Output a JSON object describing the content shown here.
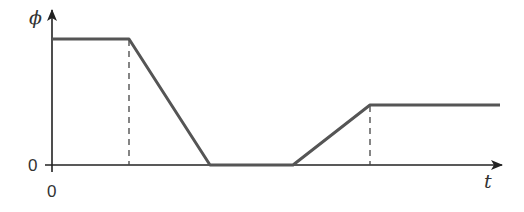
{
  "diagram": {
    "y_axis_label": "ϕ",
    "x_axis_label": "t",
    "y_origin_label": "0",
    "x_origin_label": "0",
    "colors": {
      "curve": "#555555",
      "axis": "#222222",
      "dashed": "#444444"
    },
    "curve_points_px": [
      [
        52,
        39
      ],
      [
        129,
        39
      ],
      [
        210,
        165
      ],
      [
        293,
        165
      ],
      [
        370,
        105
      ],
      [
        500,
        105
      ]
    ],
    "dashed_guides_px": [
      {
        "x": 129,
        "y_top": 39,
        "y_bottom": 165
      },
      {
        "x": 370,
        "y_top": 105,
        "y_bottom": 165
      }
    ]
  }
}
